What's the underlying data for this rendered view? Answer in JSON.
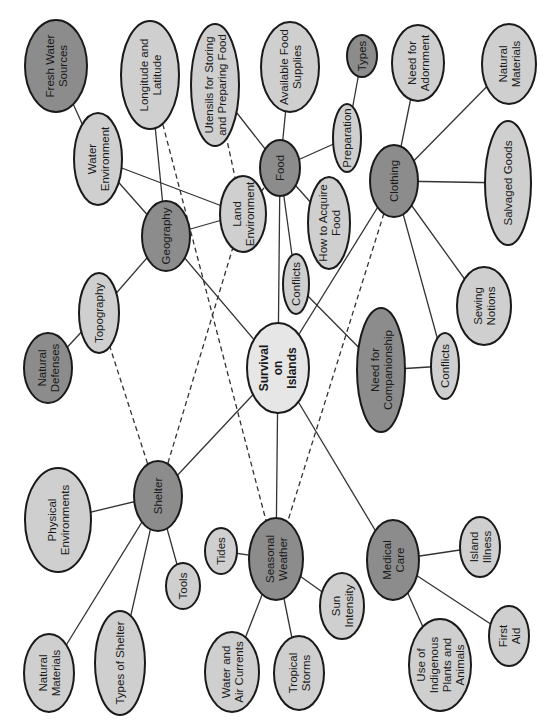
{
  "colors": {
    "dark_fill": "#8c8c8c",
    "light_fill": "#cfcfcf",
    "root_fill": "#e6e6e6",
    "stroke": "#1a1a1a",
    "edge": "#333333"
  },
  "text_rotation_deg": -90,
  "nodes": [
    {
      "id": "survival",
      "label": [
        "Survival",
        "on",
        "Islands"
      ],
      "cx": 278,
      "cy": 368,
      "rx": 31,
      "ry": 45,
      "tone": "root"
    },
    {
      "id": "geography",
      "label": [
        "Geography"
      ],
      "cx": 166,
      "cy": 236,
      "rx": 24,
      "ry": 35,
      "tone": "dark"
    },
    {
      "id": "food",
      "label": [
        "Food"
      ],
      "cx": 280,
      "cy": 168,
      "rx": 20,
      "ry": 28,
      "tone": "dark"
    },
    {
      "id": "clothing",
      "label": [
        "Clothing"
      ],
      "cx": 394,
      "cy": 181,
      "rx": 24,
      "ry": 36,
      "tone": "dark"
    },
    {
      "id": "shelter",
      "label": [
        "Shelter"
      ],
      "cx": 158,
      "cy": 496,
      "rx": 24,
      "ry": 35,
      "tone": "dark"
    },
    {
      "id": "seasonal-weather",
      "label": [
        "Seasonal",
        "Weather"
      ],
      "cx": 276,
      "cy": 559,
      "rx": 27,
      "ry": 41,
      "tone": "dark"
    },
    {
      "id": "medical-care",
      "label": [
        "Medical",
        "Care"
      ],
      "cx": 393,
      "cy": 560,
      "rx": 26,
      "ry": 40,
      "tone": "dark"
    },
    {
      "id": "need-for-companionship",
      "label": [
        "Need for",
        "Companionship"
      ],
      "cx": 381,
      "cy": 370,
      "rx": 24,
      "ry": 62,
      "tone": "dark"
    },
    {
      "id": "fresh-water-sources",
      "label": [
        "Fresh Water",
        "Sources"
      ],
      "cx": 56,
      "cy": 66,
      "rx": 31,
      "ry": 46,
      "tone": "dark"
    },
    {
      "id": "natural-defenses",
      "label": [
        "Natural",
        "Defenses"
      ],
      "cx": 48,
      "cy": 368,
      "rx": 24,
      "ry": 35,
      "tone": "dark"
    },
    {
      "id": "types",
      "label": [
        "Types"
      ],
      "cx": 362,
      "cy": 56,
      "rx": 15,
      "ry": 21,
      "tone": "dark"
    },
    {
      "id": "longitude-latitude",
      "label": [
        "Longitude and",
        "Latitude"
      ],
      "cx": 150,
      "cy": 75,
      "rx": 29,
      "ry": 54,
      "tone": "light"
    },
    {
      "id": "utensils",
      "label": [
        "Utensils for Storing",
        "and Preparing Food"
      ],
      "cx": 215,
      "cy": 85,
      "rx": 24,
      "ry": 61,
      "tone": "light"
    },
    {
      "id": "available-food-supplies",
      "label": [
        "Available Food",
        "Supplies"
      ],
      "cx": 290,
      "cy": 67,
      "rx": 29,
      "ry": 45,
      "tone": "light"
    },
    {
      "id": "need-for-adornment",
      "label": [
        "Need for",
        "Adornment"
      ],
      "cx": 418,
      "cy": 63,
      "rx": 26,
      "ry": 38,
      "tone": "light"
    },
    {
      "id": "natural-materials-clothing",
      "label": [
        "Natural",
        "Materials"
      ],
      "cx": 509,
      "cy": 64,
      "rx": 27,
      "ry": 40,
      "tone": "light"
    },
    {
      "id": "water-environment",
      "label": [
        "Water",
        "Environment"
      ],
      "cx": 98,
      "cy": 159,
      "rx": 24,
      "ry": 46,
      "tone": "light"
    },
    {
      "id": "preparation",
      "label": [
        "Preparation"
      ],
      "cx": 347,
      "cy": 138,
      "rx": 14,
      "ry": 34,
      "tone": "light"
    },
    {
      "id": "salvaged-goods",
      "label": [
        "Salvaged Goods"
      ],
      "cx": 508,
      "cy": 183,
      "rx": 23,
      "ry": 62,
      "tone": "light"
    },
    {
      "id": "land-environment",
      "label": [
        "Land",
        "Environment"
      ],
      "cx": 243,
      "cy": 214,
      "rx": 23,
      "ry": 38,
      "tone": "light"
    },
    {
      "id": "how-to-acquire-food",
      "label": [
        "How to Acquire",
        "Food"
      ],
      "cx": 329,
      "cy": 223,
      "rx": 21,
      "ry": 46,
      "tone": "light"
    },
    {
      "id": "topography",
      "label": [
        "Topography"
      ],
      "cx": 99,
      "cy": 313,
      "rx": 20,
      "ry": 40,
      "tone": "light"
    },
    {
      "id": "conflicts-food",
      "label": [
        "Conflicts"
      ],
      "cx": 296,
      "cy": 284,
      "rx": 13,
      "ry": 30,
      "tone": "light"
    },
    {
      "id": "sewing-notions",
      "label": [
        "Sewing",
        "Notions"
      ],
      "cx": 484,
      "cy": 306,
      "rx": 27,
      "ry": 39,
      "tone": "light"
    },
    {
      "id": "conflicts-companionship",
      "label": [
        "Conflicts"
      ],
      "cx": 445,
      "cy": 366,
      "rx": 14,
      "ry": 33,
      "tone": "light"
    },
    {
      "id": "physical-environments",
      "label": [
        "Physical",
        "Environments"
      ],
      "cx": 58,
      "cy": 520,
      "rx": 33,
      "ry": 52,
      "tone": "light"
    },
    {
      "id": "tides",
      "label": [
        "Tides"
      ],
      "cx": 221,
      "cy": 551,
      "rx": 16,
      "ry": 23,
      "tone": "light"
    },
    {
      "id": "tools",
      "label": [
        "Tools"
      ],
      "cx": 183,
      "cy": 586,
      "rx": 17,
      "ry": 23,
      "tone": "light"
    },
    {
      "id": "island-illness",
      "label": [
        "Island",
        "Illness"
      ],
      "cx": 480,
      "cy": 547,
      "rx": 20,
      "ry": 30,
      "tone": "light"
    },
    {
      "id": "sun-intensity",
      "label": [
        "Sun",
        "Intensity"
      ],
      "cx": 342,
      "cy": 606,
      "rx": 22,
      "ry": 33,
      "tone": "light"
    },
    {
      "id": "indigenous-plants-animals",
      "label": [
        "Use of",
        "Indigenous",
        "Plants and",
        "Animals"
      ],
      "cx": 440,
      "cy": 665,
      "rx": 31,
      "ry": 46,
      "tone": "light"
    },
    {
      "id": "first-aid",
      "label": [
        "First",
        "Aid"
      ],
      "cx": 509,
      "cy": 636,
      "rx": 20,
      "ry": 30,
      "tone": "light"
    },
    {
      "id": "natural-materials-shelter",
      "label": [
        "Natural",
        "Materials"
      ],
      "cx": 49,
      "cy": 673,
      "rx": 25,
      "ry": 39,
      "tone": "light"
    },
    {
      "id": "types-of-shelter",
      "label": [
        "Types of Shelter"
      ],
      "cx": 120,
      "cy": 663,
      "rx": 25,
      "ry": 52,
      "tone": "light"
    },
    {
      "id": "water-air-currents",
      "label": [
        "Water and",
        "Air Currents"
      ],
      "cx": 232,
      "cy": 672,
      "rx": 27,
      "ry": 40,
      "tone": "light"
    },
    {
      "id": "tropical-storms",
      "label": [
        "Tropical",
        "Storms"
      ],
      "cx": 299,
      "cy": 673,
      "rx": 25,
      "ry": 37,
      "tone": "light"
    }
  ],
  "edges": [
    {
      "from": "survival",
      "to": "geography",
      "style": "solid"
    },
    {
      "from": "survival",
      "to": "food",
      "style": "solid"
    },
    {
      "from": "survival",
      "to": "clothing",
      "style": "solid"
    },
    {
      "from": "survival",
      "to": "shelter",
      "style": "solid"
    },
    {
      "from": "survival",
      "to": "seasonal-weather",
      "style": "solid"
    },
    {
      "from": "survival",
      "to": "medical-care",
      "style": "solid"
    },
    {
      "from": "geography",
      "to": "longitude-latitude",
      "style": "solid"
    },
    {
      "from": "geography",
      "to": "water-environment",
      "style": "solid"
    },
    {
      "from": "geography",
      "to": "land-environment",
      "style": "solid"
    },
    {
      "from": "geography",
      "to": "topography",
      "style": "solid"
    },
    {
      "from": "water-environment",
      "to": "fresh-water-sources",
      "style": "solid"
    },
    {
      "from": "water-environment",
      "to": "land-environment",
      "style": "solid"
    },
    {
      "from": "topography",
      "to": "natural-defenses",
      "style": "solid"
    },
    {
      "from": "food",
      "to": "utensils",
      "style": "solid"
    },
    {
      "from": "food",
      "to": "available-food-supplies",
      "style": "solid"
    },
    {
      "from": "food",
      "to": "preparation",
      "style": "solid"
    },
    {
      "from": "food",
      "to": "how-to-acquire-food",
      "style": "solid"
    },
    {
      "from": "food",
      "to": "conflicts-food",
      "style": "solid"
    },
    {
      "from": "preparation",
      "to": "types",
      "style": "solid"
    },
    {
      "from": "conflicts-food",
      "to": "need-for-companionship",
      "style": "solid"
    },
    {
      "from": "clothing",
      "to": "need-for-adornment",
      "style": "solid"
    },
    {
      "from": "clothing",
      "to": "natural-materials-clothing",
      "style": "solid"
    },
    {
      "from": "clothing",
      "to": "salvaged-goods",
      "style": "solid"
    },
    {
      "from": "clothing",
      "to": "sewing-notions",
      "style": "solid"
    },
    {
      "from": "clothing",
      "to": "conflicts-companionship",
      "style": "solid"
    },
    {
      "from": "need-for-companionship",
      "to": "conflicts-companionship",
      "style": "solid"
    },
    {
      "from": "shelter",
      "to": "physical-environments",
      "style": "solid"
    },
    {
      "from": "shelter",
      "to": "natural-materials-shelter",
      "style": "solid"
    },
    {
      "from": "shelter",
      "to": "types-of-shelter",
      "style": "solid"
    },
    {
      "from": "shelter",
      "to": "tools",
      "style": "solid"
    },
    {
      "from": "seasonal-weather",
      "to": "tides",
      "style": "solid"
    },
    {
      "from": "seasonal-weather",
      "to": "water-air-currents",
      "style": "solid"
    },
    {
      "from": "seasonal-weather",
      "to": "tropical-storms",
      "style": "solid"
    },
    {
      "from": "seasonal-weather",
      "to": "sun-intensity",
      "style": "solid"
    },
    {
      "from": "medical-care",
      "to": "island-illness",
      "style": "solid"
    },
    {
      "from": "medical-care",
      "to": "first-aid",
      "style": "solid"
    },
    {
      "from": "medical-care",
      "to": "indigenous-plants-animals",
      "style": "solid"
    },
    {
      "from": "utensils",
      "to": "land-environment",
      "style": "dashed"
    },
    {
      "from": "food",
      "to": "land-environment",
      "style": "dashed"
    },
    {
      "from": "topography",
      "to": "shelter",
      "style": "dashed"
    },
    {
      "from": "land-environment",
      "to": "shelter",
      "style": "dashed"
    },
    {
      "from": "longitude-latitude",
      "to": "seasonal-weather",
      "style": "dashed"
    },
    {
      "from": "clothing",
      "to": "seasonal-weather",
      "style": "dashed"
    }
  ]
}
